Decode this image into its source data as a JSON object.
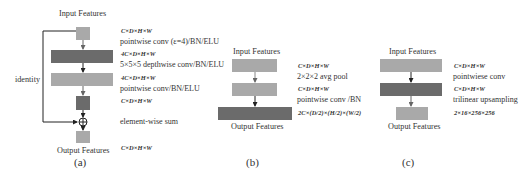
{
  "panel_a": {
    "caption": "(a)",
    "input_label": "Input Features",
    "output_label": "Output Features",
    "identity_label": "identity",
    "annotations": {
      "dim_1": "C×D×H×W",
      "op_1": "pointwise conv (ε=4)/BN/ELU",
      "dim_2": "4C×D×H×W",
      "op_2": "5×5×5 depthwise conv/BN/ELU",
      "dim_3": "4C×D×H×W",
      "op_3": "pointwise conv/BN/ELU",
      "dim_4": "C×D×H×W",
      "op_4": "element-wise sum",
      "dim_5": "C×D×H×W"
    }
  },
  "panel_b": {
    "caption": "(b)",
    "input_label": "Input Features",
    "output_label": "Output Features",
    "annotations": {
      "dim_1": "C×D×H×W",
      "op_1": "2×2×2 avg pool",
      "dim_2": "C×D×H×W",
      "op_2": "pointwise conv /BN",
      "dim_3": "2C×(D/2)×(H/2)×(W/2)"
    }
  },
  "panel_c": {
    "caption": "(c)",
    "input_label": "Input Features",
    "output_label": "Output Features",
    "annotations": {
      "dim_1": "C×D×H×W",
      "op_1": "pointwiese conv",
      "dim_2": "C×D×H×W",
      "op_2": "trilinear upsampling",
      "dim_3": "2×16×256×256"
    }
  },
  "colors": {
    "light_block": "#a9a9a9",
    "dark_block": "#6b6b6b",
    "arrow": "#222222"
  }
}
